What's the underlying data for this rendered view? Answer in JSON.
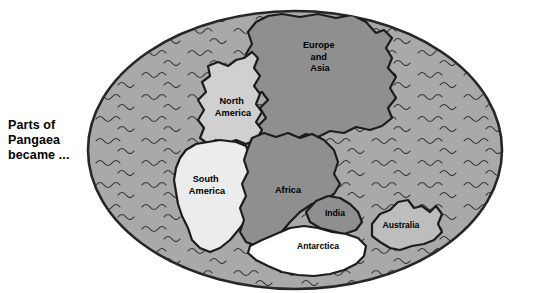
{
  "caption": {
    "lines": [
      "Parts of",
      "Pangaea",
      "became ..."
    ]
  },
  "map": {
    "title": "Pangaea supercontinent",
    "ocean_label": "ocean",
    "colors": {
      "ocean": "#a9a9a9",
      "ocean_edge": "#262626",
      "outline": "#1c1c1c",
      "europe_asia": "#8f8f8f",
      "africa": "#8f8f8f",
      "india": "#8f8f8f",
      "north_america": "#d0d0d0",
      "south_america": "#ececec",
      "australia": "#bdbdbd",
      "antarctica": "#ffffff",
      "wave": "#2b2b2b",
      "text": "#000000"
    },
    "landmasses": [
      {
        "id": "europe-and-asia",
        "label": "Europe\nand\nAsia",
        "label_lines": [
          "Europe",
          "and",
          "Asia"
        ],
        "fill": "europe_asia",
        "label_x": 320,
        "label_y": 48
      },
      {
        "id": "north-america",
        "label": "North America",
        "label_lines": [
          "North",
          "America"
        ],
        "fill": "north_america",
        "label_x": 233,
        "label_y": 104
      },
      {
        "id": "south-america",
        "label": "South America",
        "label_lines": [
          "South",
          "America"
        ],
        "fill": "south_america",
        "label_x": 207,
        "label_y": 182
      },
      {
        "id": "africa",
        "label": "Africa",
        "label_lines": [
          "Africa"
        ],
        "fill": "africa",
        "label_x": 288,
        "label_y": 193
      },
      {
        "id": "india",
        "label": "India",
        "label_lines": [
          "India"
        ],
        "fill": "india",
        "label_x": 335,
        "label_y": 215
      },
      {
        "id": "australia",
        "label": "Australia",
        "label_lines": [
          "Australia"
        ],
        "fill": "australia",
        "label_x": 400,
        "label_y": 227
      },
      {
        "id": "antarctica",
        "label": "Antarctica",
        "label_lines": [
          "Antarctica"
        ],
        "fill": "antarctica",
        "label_x": 318,
        "label_y": 248
      }
    ]
  }
}
